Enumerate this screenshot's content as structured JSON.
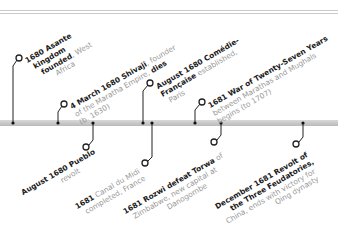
{
  "timeline": {
    "colors": {
      "bar": "#c4c4c4",
      "connector": "#222222",
      "title": "#1a1a1a",
      "detail": "#9a9a9a"
    },
    "events": [
      {
        "id": "asante",
        "side": "above",
        "bold1": "1680 Asante",
        "bold2": "kingdom",
        "bold3": "founded",
        "rest3": ", West",
        "rest4": "Africa"
      },
      {
        "id": "shivaji",
        "side": "above",
        "bold1": "4 March 1680 Shivaji",
        "rest1": ", founder",
        "rest2": "of the Maratha Empire, ",
        "bold2": "dies",
        "rest3": "(b. 1630)"
      },
      {
        "id": "comedie",
        "side": "above",
        "bold1": "August 1680 Comédie-",
        "bold2": "Française",
        "rest2": " established,",
        "rest3": "Paris"
      },
      {
        "id": "war27",
        "side": "above",
        "bold1": "1681 War of Twenty-Seven Years",
        "rest2": "between Marathas and Mughals",
        "rest3": "begins (to 1707)"
      },
      {
        "id": "pueblo",
        "side": "below",
        "bold1": "August 1680 Pueblo",
        "bold2": "revolt"
      },
      {
        "id": "canal",
        "side": "below",
        "bold1": "1681",
        "rest1": " Canal du Midi",
        "rest2": "completed, France"
      },
      {
        "id": "rozwi",
        "side": "below",
        "bold1": "1681 Rozwi defeat Torwa",
        "rest1": " of",
        "rest2": "Zimbabwe, new capital at",
        "rest3": "Danogombe"
      },
      {
        "id": "feudatories",
        "side": "below",
        "bold1": "December 1681 Revolt of",
        "bold2": "the Three Feudatories,",
        "rest3": "China, ends with victory for",
        "rest4": "Qing dynasty"
      }
    ]
  }
}
